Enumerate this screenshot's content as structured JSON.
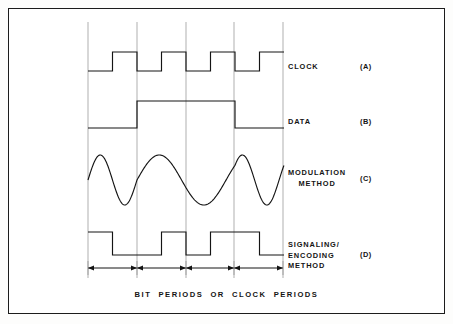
{
  "figure": {
    "caption": "BIT  PERIODS  OR  CLOCK  PERIODS",
    "frame": {
      "x": 8,
      "y": 8,
      "width": 437,
      "height": 306,
      "stroke": "#1c1c1c"
    },
    "background": "#ffffff",
    "ink_color": "#141414",
    "guide_color": "#8d8d8d"
  },
  "axis": {
    "grid_x_positions": [
      88,
      137,
      186,
      234,
      283
    ],
    "grid_top": 22,
    "grid_bottom": 278,
    "bit_period_px": 49,
    "period_count": 4
  },
  "waveforms": [
    {
      "id": "clock",
      "label": "CLOCK",
      "tag": "(A)",
      "label_x": 288,
      "label_y": 62,
      "tag_x": 360,
      "tag_y": 62,
      "type": "square",
      "high_y": 52,
      "low_y": 71,
      "start_x": 88,
      "end_x": 283,
      "bits": [
        0,
        1,
        0,
        1,
        0,
        1,
        0,
        1
      ],
      "half_period_px": 24.5,
      "description": "Symmetric clock, one full cycle per bit period"
    },
    {
      "id": "data",
      "label": "DATA",
      "tag": "(B)",
      "label_x": 288,
      "label_y": 117,
      "tag_x": 360,
      "tag_y": 117,
      "type": "square",
      "high_y": 101,
      "low_y": 128,
      "start_x": 88,
      "end_x": 283,
      "bit_values": [
        0,
        1,
        1,
        0
      ],
      "description": "NRZ data: low for bit 1, high for bits 2 and 3, low for bit 4"
    },
    {
      "id": "modulation",
      "label": "MODULATION\nMETHOD",
      "label_line1": "MODULATION",
      "label_line2": "METHOD",
      "tag": "(C)",
      "label_x": 288,
      "label_y": 168,
      "tag_x": 360,
      "tag_y": 174,
      "type": "sine",
      "center_y": 180,
      "amplitude": 25,
      "start_x": 88,
      "end_x": 283,
      "cycles_per_bit": [
        1.0,
        0.55,
        0.55,
        1.0
      ],
      "description": "Frequency-shift keyed carrier: high frequency for bit 1 and bit 4, low frequency for bits 2 and 3"
    },
    {
      "id": "signaling",
      "label": "SIGNALING/\nENCODING\nMETHOD",
      "label_line1": "SIGNALING/",
      "label_line2": "ENCODING",
      "label_line3": "METHOD",
      "tag": "(D)",
      "label_x": 288,
      "label_y": 240,
      "tag_x": 360,
      "tag_y": 250,
      "type": "square",
      "high_y": 232,
      "low_y": 255,
      "start_x": 88,
      "end_x": 283,
      "description": "Manchester / self-clocking encoded waveform with mid-bit transitions"
    }
  ],
  "bit_period_markers": {
    "y": 268,
    "arrow_color": "#141414",
    "segments": [
      {
        "from": 88,
        "to": 137
      },
      {
        "from": 137,
        "to": 186
      },
      {
        "from": 186,
        "to": 234
      },
      {
        "from": 234,
        "to": 283
      }
    ]
  }
}
